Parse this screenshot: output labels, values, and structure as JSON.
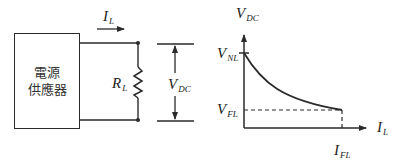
{
  "circuit": {
    "power_supply": {
      "line1": "電源",
      "line2": "供應器"
    },
    "current_label": {
      "main": "I",
      "sub": "L"
    },
    "resistor_label": {
      "main": "R",
      "sub": "L"
    },
    "voltage_label": {
      "main": "V",
      "sub": "DC"
    }
  },
  "graph": {
    "y_axis_label": {
      "main": "V",
      "sub": "DC"
    },
    "x_axis_label": {
      "main": "I",
      "sub": "L"
    },
    "v_nl_label": {
      "main": "V",
      "sub": "NL"
    },
    "v_fl_label": {
      "main": "V",
      "sub": "FL"
    },
    "i_fl_label": {
      "main": "I",
      "sub": "FL"
    }
  },
  "colors": {
    "stroke": "#2a2a2a",
    "background": "#ffffff"
  }
}
